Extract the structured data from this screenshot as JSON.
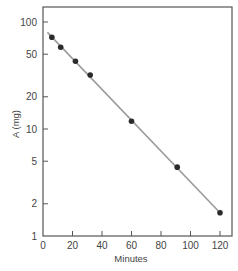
{
  "chart_data": {
    "type": "scatter",
    "title": "",
    "xlabel": "Minutes",
    "ylabel": "A (mg)",
    "xlim": [
      0,
      120
    ],
    "ylim": [
      1,
      150
    ],
    "yscale": "log",
    "grid": false,
    "x_ticks": [
      0,
      20,
      40,
      60,
      80,
      100,
      120
    ],
    "x_tick_labels": [
      "0",
      "20",
      "40",
      "60",
      "80",
      "100",
      "120"
    ],
    "y_ticks": [
      1,
      2,
      5,
      10,
      20,
      50,
      100
    ],
    "y_tick_labels": [
      "1",
      "2",
      "5",
      "10",
      "20",
      "50",
      "100"
    ],
    "series": [
      {
        "name": "observed",
        "type": "scatter",
        "x": [
          6,
          12,
          22,
          32,
          60,
          91,
          120
        ],
        "y": [
          72,
          58,
          43,
          32,
          11.8,
          4.4,
          1.65
        ]
      },
      {
        "name": "fit",
        "type": "line",
        "x": [
          3,
          120
        ],
        "y": [
          80,
          1.65
        ]
      }
    ],
    "colors": {
      "points": "#2b2b2b",
      "line": "#9a9a9a",
      "axis": "#555555"
    }
  }
}
